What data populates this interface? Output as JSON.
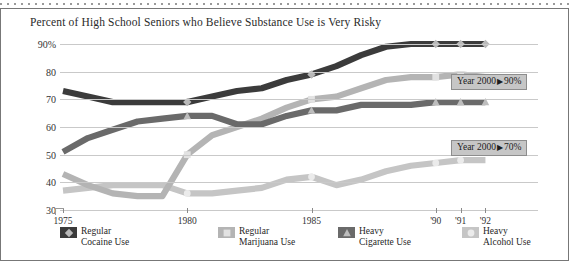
{
  "chart_data": {
    "type": "line",
    "title": "Percent of High School Seniors who Believe Substance Use is Very Risky",
    "xlabel": "",
    "ylabel": "",
    "ylim": [
      30,
      90
    ],
    "yticks": [
      30,
      40,
      50,
      60,
      70,
      80,
      90
    ],
    "ytick_labels": [
      "30",
      "40",
      "50",
      "60",
      "70",
      "80",
      "90%"
    ],
    "xticks": [
      1975,
      1980,
      1985,
      1990,
      1991,
      1992,
      2000
    ],
    "xtick_labels": [
      "1975",
      "1980",
      "1985",
      "'90",
      "'91",
      "'92",
      "2000"
    ],
    "axis_break": "/ /",
    "grid": true,
    "legend_position": "below",
    "series": [
      {
        "name": "Regular Cocaine Use",
        "color": "#3b3b3b",
        "marker": "diamond",
        "marker_color": "#b9b9b9",
        "x": [
          1975,
          1976,
          1977,
          1978,
          1979,
          1980,
          1981,
          1982,
          1983,
          1984,
          1985,
          1986,
          1987,
          1988,
          1989,
          1990,
          1991,
          1992
        ],
        "values": [
          73,
          71,
          69,
          69,
          69,
          69,
          71,
          73,
          74,
          77,
          79,
          82,
          86,
          89,
          90,
          90,
          90,
          90
        ],
        "marker_points": [
          {
            "x": 1980,
            "y": 69
          },
          {
            "x": 1985,
            "y": 79
          },
          {
            "x": 1990,
            "y": 90
          },
          {
            "x": 1991,
            "y": 90
          },
          {
            "x": 1992,
            "y": 90
          }
        ]
      },
      {
        "name": "Regular Marijuana Use",
        "color": "#b4b4b4",
        "marker": "square",
        "marker_color": "#e2e2e2",
        "x": [
          1975,
          1976,
          1977,
          1978,
          1979,
          1980,
          1981,
          1982,
          1983,
          1984,
          1985,
          1986,
          1987,
          1988,
          1989,
          1990,
          1991,
          1992
        ],
        "values": [
          43,
          39,
          36,
          35,
          35,
          50,
          57,
          60,
          63,
          67,
          70,
          71,
          74,
          77,
          78,
          78,
          79,
          78
        ],
        "marker_points": [
          {
            "x": 1980,
            "y": 50
          },
          {
            "x": 1985,
            "y": 70
          },
          {
            "x": 1990,
            "y": 78
          },
          {
            "x": 1991,
            "y": 79
          },
          {
            "x": 1992,
            "y": 78
          }
        ]
      },
      {
        "name": "Heavy Cigarette Use",
        "color": "#6a6a6a",
        "marker": "triangle",
        "marker_color": "#bdbdbd",
        "x": [
          1975,
          1976,
          1977,
          1978,
          1979,
          1980,
          1981,
          1982,
          1983,
          1984,
          1985,
          1986,
          1987,
          1988,
          1989,
          1990,
          1991,
          1992
        ],
        "values": [
          51,
          56,
          59,
          62,
          63,
          64,
          64,
          61,
          61,
          64,
          66,
          66,
          68,
          68,
          68,
          69,
          69,
          69
        ],
        "marker_points": [
          {
            "x": 1980,
            "y": 64
          },
          {
            "x": 1985,
            "y": 66
          },
          {
            "x": 1990,
            "y": 69
          },
          {
            "x": 1991,
            "y": 69
          },
          {
            "x": 1992,
            "y": 69
          }
        ]
      },
      {
        "name": "Heavy Alcohol Use",
        "color": "#c5c5c5",
        "marker": "circle",
        "marker_color": "#ebebeb",
        "x": [
          1975,
          1976,
          1977,
          1978,
          1979,
          1980,
          1981,
          1982,
          1983,
          1984,
          1985,
          1986,
          1987,
          1988,
          1989,
          1990,
          1991,
          1992
        ],
        "values": [
          37,
          38,
          39,
          39,
          39,
          36,
          36,
          37,
          38,
          41,
          42,
          39,
          41,
          44,
          46,
          47,
          48,
          48
        ],
        "marker_points": [
          {
            "x": 1980,
            "y": 36
          },
          {
            "x": 1985,
            "y": 42
          },
          {
            "x": 1990,
            "y": 47
          },
          {
            "x": 1991,
            "y": 48
          }
        ]
      }
    ],
    "annotations": [
      {
        "id": "goal-cocaine-marijuana",
        "label": "Year 2000",
        "arrow": "▶",
        "value": "90%",
        "target_series": "Regular Cocaine Use"
      },
      {
        "id": "goal-cigarette-alcohol",
        "label": "Year 2000",
        "arrow": "▶",
        "value": "70%",
        "target_series": "Heavy Cigarette Use"
      }
    ]
  },
  "legend": {
    "items": [
      {
        "line1": "Regular",
        "line2": "Cocaine Use",
        "icon": "diamond-marker-icon"
      },
      {
        "line1": "Regular",
        "line2": "Marijuana Use",
        "icon": "square-marker-icon"
      },
      {
        "line1": "Heavy",
        "line2": "Cigarette Use",
        "icon": "triangle-marker-icon"
      },
      {
        "line1": "Heavy",
        "line2": "Alcohol Use",
        "icon": "circle-marker-icon"
      }
    ]
  }
}
